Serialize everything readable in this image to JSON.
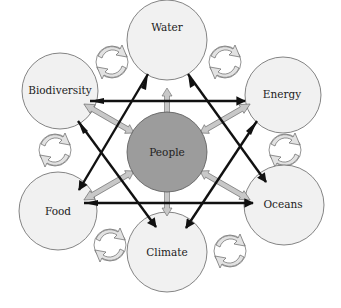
{
  "diagram": {
    "colors": {
      "node_fill": "#f1f1f1",
      "center_fill": "#9c9c9c",
      "stroke": "#555555",
      "light_arrow": "#c8c8c8",
      "dark_arrow": "#111111",
      "background": "#ffffff"
    },
    "center": {
      "id": "people",
      "label": "People"
    },
    "nodes": [
      {
        "id": "water",
        "label": "Water"
      },
      {
        "id": "energy",
        "label": "Energy"
      },
      {
        "id": "oceans",
        "label": "Oceans"
      },
      {
        "id": "climate",
        "label": "Climate"
      },
      {
        "id": "food",
        "label": "Food"
      },
      {
        "id": "biodiversity",
        "label": "Biodiversity"
      }
    ],
    "connections": {
      "center_to_nodes": "two-way light gray arrows between People and each surrounding node",
      "hexagram_triangle_1": [
        "water",
        "oceans",
        "food"
      ],
      "hexagram_triangle_2": [
        "biodiversity",
        "energy",
        "climate"
      ],
      "adjacent_cycles": "circular recycling arrows between each pair of adjacent nodes"
    }
  }
}
